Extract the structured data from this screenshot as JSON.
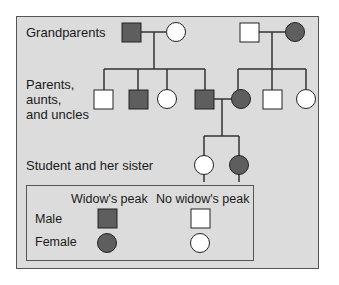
{
  "diagram": {
    "type": "pedigree",
    "trait": "Widow's peak",
    "colors": {
      "affected": "#5e5e5e",
      "unaffected": "#ffffff",
      "background": "#dcdcdc",
      "line": "#333333"
    },
    "generations": [
      {
        "label": "Grandparents"
      },
      {
        "label": "Parents,\naunts,\nand uncles"
      },
      {
        "label": "Student and her sister"
      }
    ],
    "labels": {
      "grandparents": "Grandparents",
      "parents_line1": "Parents,",
      "parents_line2": "aunts,",
      "parents_line3": "and uncles",
      "children": "Student and her sister"
    },
    "individuals": {
      "grandparents": [
        {
          "sex": "male",
          "affected": true
        },
        {
          "sex": "female",
          "affected": false
        },
        {
          "sex": "male",
          "affected": false
        },
        {
          "sex": "female",
          "affected": true
        }
      ],
      "parents_generation": [
        {
          "sex": "male",
          "affected": false
        },
        {
          "sex": "male",
          "affected": true
        },
        {
          "sex": "female",
          "affected": false
        },
        {
          "sex": "male",
          "affected": true,
          "role": "father"
        },
        {
          "sex": "female",
          "affected": true,
          "role": "mother"
        },
        {
          "sex": "male",
          "affected": false
        },
        {
          "sex": "female",
          "affected": false
        }
      ],
      "children": [
        {
          "sex": "female",
          "affected": false,
          "role": "student"
        },
        {
          "sex": "female",
          "affected": true,
          "role": "sister"
        }
      ]
    },
    "legend": {
      "col1": "Widow's peak",
      "col2": "No widow's peak",
      "row1": "Male",
      "row2": "Female"
    }
  }
}
